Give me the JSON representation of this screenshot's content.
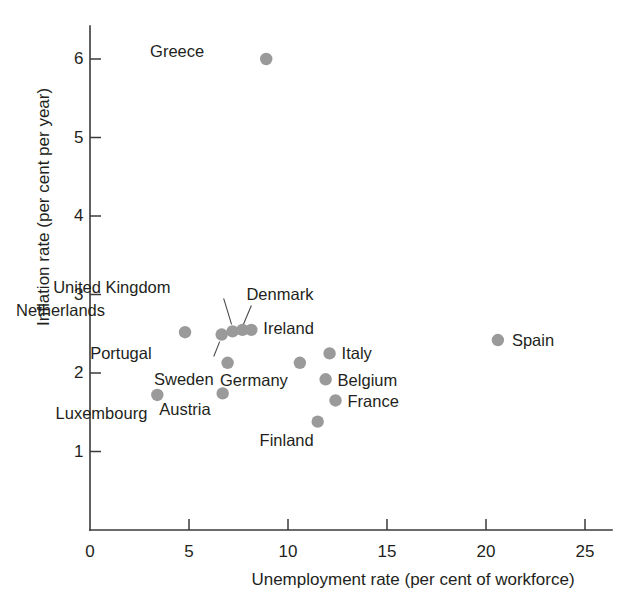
{
  "chart_data": {
    "type": "scatter",
    "title": "",
    "xlabel": "Unemployment rate (per cent of workforce)",
    "ylabel": "Inflation rate (per cent per year)",
    "xlim": [
      0,
      26.5
    ],
    "ylim": [
      0,
      6.6
    ],
    "xticks": [
      0,
      5,
      10,
      15,
      20,
      25
    ],
    "yticks": [
      1,
      2,
      3,
      4,
      5,
      6
    ],
    "xtick_labels": [
      "0",
      "5",
      "10",
      "15",
      "20",
      "25"
    ],
    "ytick_labels": [
      "1",
      "2",
      "3",
      "4",
      "5",
      "6"
    ],
    "grid": false,
    "legend": "none",
    "point_color": "#9a9a9a",
    "axis_color": "#3a3a3a",
    "points": [
      {
        "label": "Greece",
        "x": 8.9,
        "y": 6.0,
        "label_dx": -62,
        "label_dy": -8,
        "label_align": "right",
        "leader": false
      },
      {
        "label": "Netherlands",
        "x": 4.8,
        "y": 2.52,
        "label_dx": -80,
        "label_dy": -22,
        "label_align": "right",
        "leader": false
      },
      {
        "label": "Portugal",
        "x": 6.65,
        "y": 2.49,
        "label_dx": -70,
        "label_dy": 18,
        "label_align": "right",
        "leader": true,
        "leader_x1": 6.25,
        "leader_y1": 2.21,
        "leader_x2": 6.55,
        "leader_y2": 2.4
      },
      {
        "label": "United Kingdom",
        "x": 7.2,
        "y": 2.53,
        "label_dx": -62,
        "label_dy": -44,
        "label_align": "right",
        "leader": true,
        "leader_x1": 6.75,
        "leader_y1": 2.95,
        "leader_x2": 7.15,
        "leader_y2": 2.62
      },
      {
        "label": "Denmark",
        "x": 7.7,
        "y": 2.55,
        "label_dx": 4,
        "label_dy": -36,
        "label_align": "left",
        "leader": true,
        "leader_x1": 8.15,
        "leader_y1": 2.86,
        "leader_x2": 7.75,
        "leader_y2": 2.62
      },
      {
        "label": "Ireland",
        "x": 8.15,
        "y": 2.55,
        "label_dx": 12,
        "label_dy": -2,
        "label_align": "left",
        "leader": false
      },
      {
        "label": "Sweden",
        "x": 6.95,
        "y": 2.13,
        "label_dx": -14,
        "label_dy": 16,
        "label_align": "right",
        "leader": false
      },
      {
        "label": "Austria",
        "x": 6.7,
        "y": 1.74,
        "label_dx": -12,
        "label_dy": 16,
        "label_align": "right",
        "leader": false
      },
      {
        "label": "Luxembourg",
        "x": 3.4,
        "y": 1.72,
        "label_dx": -10,
        "label_dy": 18,
        "label_align": "right",
        "leader": false
      },
      {
        "label": "Germany",
        "x": 10.6,
        "y": 2.13,
        "label_dx": -12,
        "label_dy": 17,
        "label_align": "right",
        "leader": false
      },
      {
        "label": "Italy",
        "x": 12.1,
        "y": 2.25,
        "label_dx": 12,
        "label_dy": 0,
        "label_align": "left",
        "leader": false
      },
      {
        "label": "Belgium",
        "x": 11.9,
        "y": 1.92,
        "label_dx": 12,
        "label_dy": 1,
        "label_align": "left",
        "leader": false
      },
      {
        "label": "France",
        "x": 12.4,
        "y": 1.65,
        "label_dx": 12,
        "label_dy": 1,
        "label_align": "left",
        "leader": false
      },
      {
        "label": "Finland",
        "x": 11.5,
        "y": 1.38,
        "label_dx": -4,
        "label_dy": 18,
        "label_align": "right",
        "leader": false
      },
      {
        "label": "Spain",
        "x": 20.6,
        "y": 2.42,
        "label_dx": 14,
        "label_dy": 0,
        "label_align": "left",
        "leader": false
      }
    ]
  }
}
